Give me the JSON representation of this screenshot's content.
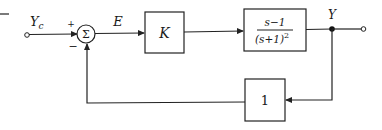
{
  "diagram": {
    "type": "feedback-block-diagram",
    "input": {
      "label": "Y",
      "subscript": "c"
    },
    "summing_junction": {
      "symbol": "Σ",
      "plus_sign": "+",
      "minus_sign": "−"
    },
    "error_signal": {
      "label": "E"
    },
    "controller_block": {
      "label": "K"
    },
    "plant_block": {
      "numerator": "s−1",
      "denominator": "(s+1)",
      "denominator_exponent": "2"
    },
    "output": {
      "label": "Y"
    },
    "feedback_block": {
      "label": "1"
    }
  },
  "colors": {
    "line": "#222222",
    "text": "#1a1a1a",
    "background": "#ffffff"
  }
}
